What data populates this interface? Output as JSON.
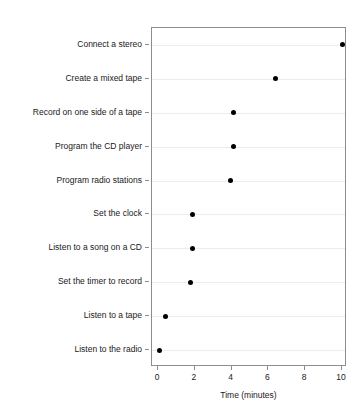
{
  "chart_data": {
    "type": "scatter",
    "subtype": "cleveland-dot-plot",
    "title": "",
    "title_clipped": true,
    "xlabel": "Time (minutes)",
    "ylabel": "",
    "xlim": [
      0,
      10
    ],
    "xticks": [
      0,
      2,
      4,
      6,
      8,
      10
    ],
    "xticklabels": [
      "0",
      "2",
      "4",
      "6",
      "8",
      "10"
    ],
    "grid": "horizontal",
    "legend": "none",
    "marker": "filled-circle",
    "marker_color": "#000000",
    "panel_border_color": "#8c8c8c",
    "gridline_color": "#ececec",
    "categories": [
      "Connect a stereo",
      "Create a mixed tape",
      "Record on one side of a tape",
      "Program the CD player",
      "Program radio stations",
      "Set the clock",
      "Listen to a song on a CD",
      "Set the timer to record",
      "Listen to a tape",
      "Listen to the radio"
    ],
    "values": [
      10.0,
      6.4,
      4.1,
      4.1,
      3.95,
      1.9,
      1.9,
      1.75,
      0.4,
      0.1
    ]
  }
}
